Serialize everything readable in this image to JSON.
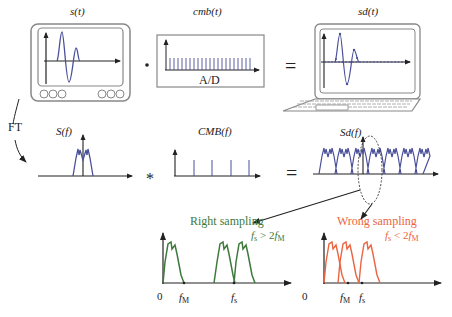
{
  "top_row": {
    "signal_label": "s(t)",
    "comb_label": "cmb(t)",
    "comb_device_text": "A/D",
    "result_label": "sd(t)",
    "multiply_op": "·",
    "equals_op": "="
  },
  "transform": {
    "arrow_label": "FT"
  },
  "middle_row": {
    "spectrum_label": "S(f)",
    "comb_spectrum_label": "CMB(f)",
    "result_spectrum_label": "Sd(f)",
    "convolve_op": "*",
    "equals_op": "="
  },
  "bottom_left": {
    "title": "Right sampling",
    "condition": "fs > 2fM",
    "condition_parts": {
      "f": "f",
      "s": "s",
      "rel": " > 2",
      "f2": "f",
      "M": "M"
    },
    "axis_origin": "0",
    "tick_fM": {
      "f": "f",
      "sub": "M"
    },
    "tick_fs": {
      "f": "f",
      "sub": "s"
    },
    "color": "#3e7a3c"
  },
  "bottom_right": {
    "title": "Wrong sampling",
    "condition": "fs < 2fM",
    "condition_parts": {
      "f": "f",
      "s": "s",
      "rel": " < 2",
      "f2": "f",
      "M": "M"
    },
    "axis_origin": "0",
    "tick_fM": {
      "f": "f",
      "sub": "M"
    },
    "tick_fs": {
      "f": "f",
      "sub": "s"
    },
    "color": "#ec6440"
  },
  "colors": {
    "signal": "#4a4f9a",
    "right": "#3e7a3c",
    "wrong": "#ec6440",
    "ink": "#222222",
    "device": "#888888"
  }
}
